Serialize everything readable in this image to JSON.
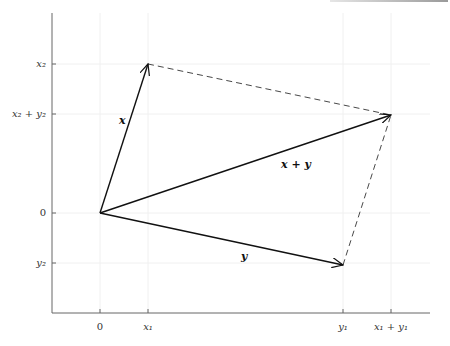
{
  "diagram": {
    "type": "vector-addition-parallelogram",
    "origin": "0",
    "x_ticks": [
      "0",
      "x₁",
      "y₁",
      "x₁ + y₁"
    ],
    "y_ticks": [
      "x₂",
      "x₂ + y₂",
      "0",
      "y₂"
    ],
    "vectors": [
      {
        "name": "x",
        "label": "x",
        "from": "(0,0)",
        "to": "(x₁,x₂)"
      },
      {
        "name": "y",
        "label": "y",
        "from": "(0,0)",
        "to": "(y₁,y₂)"
      },
      {
        "name": "x+y",
        "label": "x + y",
        "from": "(0,0)",
        "to": "(x₁+y₁, x₂+y₂)"
      }
    ],
    "dashed_edges": [
      "(x₁,x₂) → (x₁+y₁,x₂+y₂)",
      "(y₁,y₂) → (x₁+y₁,x₂+y₂)"
    ],
    "colors": {
      "axis": "#666666",
      "vector": "#111111",
      "grid": "#f0f0f0"
    }
  }
}
